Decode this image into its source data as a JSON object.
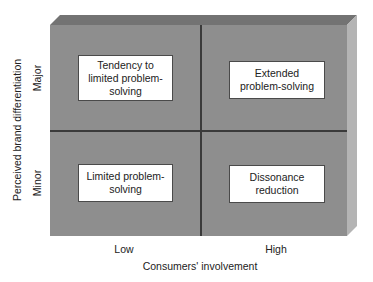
{
  "diagram": {
    "type": "2x2 matrix",
    "x_axis": {
      "title": "Consumers' involvement",
      "ticks": [
        "Low",
        "High"
      ]
    },
    "y_axis": {
      "title": "Perceived brand differentiation",
      "ticks": [
        "Major",
        "Minor"
      ]
    },
    "quadrants": {
      "top_left": {
        "x": "Low",
        "y": "Major",
        "label": "Tendency to limited problem-solving"
      },
      "top_right": {
        "x": "High",
        "y": "Major",
        "label": "Extended problem-solving"
      },
      "bottom_left": {
        "x": "Low",
        "y": "Minor",
        "label": "Limited problem-solving"
      },
      "bottom_right": {
        "x": "High",
        "y": "Minor",
        "label": "Dissonance reduction"
      }
    },
    "colors": {
      "face": "#8e8e8e",
      "top_bevel": "#737373",
      "side_bevel": "#b4b4b4",
      "divider": "#3a3a3a",
      "box_fill": "#ffffff"
    }
  }
}
